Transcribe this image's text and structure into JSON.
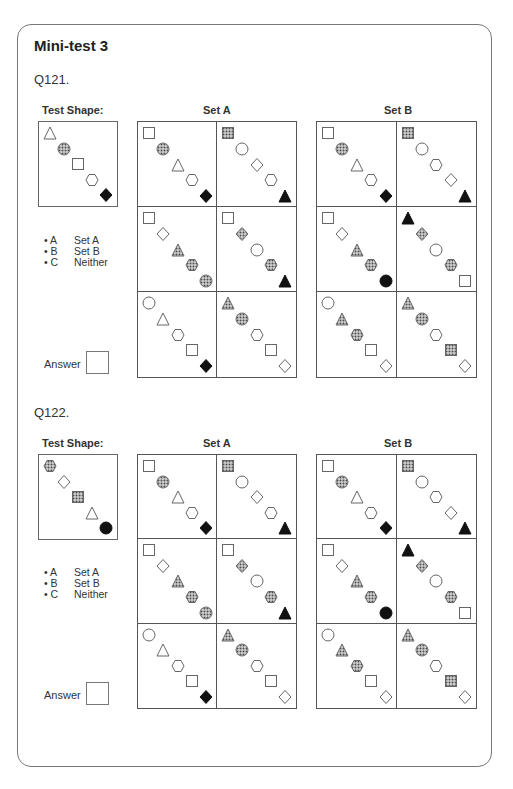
{
  "page": {
    "title": "Mini-test 3",
    "colors": {
      "border": "#777777",
      "ink": "#222222",
      "dotted_fill": "#8a8a8a",
      "solid_fill": "#111111"
    }
  },
  "legend": {
    "options": [
      {
        "key": "• A",
        "label": "Set A"
      },
      {
        "key": "• B",
        "label": "Set B"
      },
      {
        "key": "• C",
        "label": "Neither"
      }
    ],
    "answer_label": "Answer"
  },
  "questions": [
    {
      "label": "Q121.",
      "test_shape_label": "Test Shape:",
      "set_a_label": "Set A",
      "set_b_label": "Set B",
      "test_shape": [
        "triangle-outline",
        "circle-dotted",
        "square-outline",
        "hexagon-outline",
        "diamond-solid"
      ],
      "set_a": [
        [
          "square-outline",
          "circle-dotted",
          "triangle-outline",
          "hexagon-outline",
          "diamond-solid"
        ],
        [
          "square-dotted",
          "circle-outline",
          "diamond-outline",
          "hexagon-outline",
          "triangle-solid"
        ],
        [
          "square-outline",
          "diamond-outline",
          "triangle-dotted",
          "hexagon-dotted",
          "circle-dotted"
        ],
        [
          "square-outline",
          "diamond-dotted",
          "circle-outline",
          "hexagon-dotted",
          "triangle-solid"
        ],
        [
          "circle-outline",
          "triangle-outline",
          "hexagon-outline",
          "square-outline",
          "diamond-solid"
        ],
        [
          "triangle-dotted",
          "circle-dotted",
          "hexagon-outline",
          "square-outline",
          "diamond-outline"
        ]
      ],
      "set_b": [
        [
          "square-outline",
          "circle-dotted",
          "triangle-outline",
          "hexagon-outline",
          "diamond-solid"
        ],
        [
          "square-dotted",
          "circle-outline",
          "hexagon-outline",
          "diamond-outline",
          "triangle-solid"
        ],
        [
          "square-outline",
          "diamond-outline",
          "triangle-dotted",
          "hexagon-dotted",
          "circle-solid"
        ],
        [
          "triangle-solid",
          "diamond-dotted",
          "circle-outline",
          "hexagon-dotted",
          "square-outline"
        ],
        [
          "circle-outline",
          "triangle-dotted",
          "hexagon-dotted",
          "square-outline",
          "diamond-outline"
        ],
        [
          "triangle-dotted",
          "circle-dotted",
          "hexagon-outline",
          "square-dotted",
          "diamond-outline"
        ]
      ]
    },
    {
      "label": "Q122.",
      "test_shape_label": "Test Shape:",
      "set_a_label": "Set A",
      "set_b_label": "Set B",
      "test_shape": [
        "hexagon-dotted",
        "diamond-outline",
        "square-dotted",
        "triangle-outline",
        "circle-solid"
      ],
      "set_a": [
        [
          "square-outline",
          "circle-dotted",
          "triangle-outline",
          "hexagon-outline",
          "diamond-solid"
        ],
        [
          "square-dotted",
          "circle-outline",
          "diamond-outline",
          "hexagon-outline",
          "triangle-solid"
        ],
        [
          "square-outline",
          "diamond-outline",
          "triangle-dotted",
          "hexagon-dotted",
          "circle-dotted"
        ],
        [
          "square-outline",
          "diamond-dotted",
          "circle-outline",
          "hexagon-dotted",
          "triangle-solid"
        ],
        [
          "circle-outline",
          "triangle-outline",
          "hexagon-outline",
          "square-outline",
          "diamond-solid"
        ],
        [
          "triangle-dotted",
          "circle-dotted",
          "hexagon-outline",
          "square-outline",
          "diamond-outline"
        ]
      ],
      "set_b": [
        [
          "square-outline",
          "circle-dotted",
          "triangle-outline",
          "hexagon-outline",
          "diamond-solid"
        ],
        [
          "square-dotted",
          "circle-outline",
          "hexagon-outline",
          "diamond-outline",
          "triangle-solid"
        ],
        [
          "square-outline",
          "diamond-outline",
          "triangle-dotted",
          "hexagon-dotted",
          "circle-solid"
        ],
        [
          "triangle-solid",
          "diamond-dotted",
          "circle-outline",
          "hexagon-dotted",
          "square-outline"
        ],
        [
          "circle-outline",
          "triangle-dotted",
          "hexagon-dotted",
          "square-outline",
          "diamond-outline"
        ],
        [
          "triangle-dotted",
          "circle-dotted",
          "hexagon-outline",
          "square-dotted",
          "diamond-outline"
        ]
      ]
    }
  ]
}
